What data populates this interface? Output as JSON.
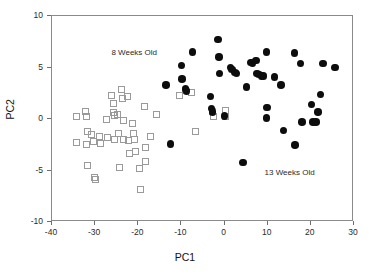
{
  "chart_data": {
    "type": "scatter",
    "title": "",
    "xlabel": "PC1",
    "ylabel": "PC2",
    "xlim": [
      -40,
      30
    ],
    "ylim": [
      -10,
      10
    ],
    "xticks": [
      -40,
      -30,
      -20,
      -10,
      0,
      10,
      20,
      30
    ],
    "yticks": [
      -10,
      -5,
      0,
      5,
      10
    ],
    "xticklabels": [
      "-40",
      "-30",
      "-20",
      "-10",
      "0",
      "10",
      "20",
      "30"
    ],
    "yticklabels": [
      "-10",
      "-5",
      "0",
      "5",
      "10"
    ],
    "grid": false,
    "legend_position": "in-plot-annotations",
    "annotations": [
      {
        "text": "8 Weeks Old",
        "x": -26.0,
        "y": 6.2
      },
      {
        "text": "13 Weeks Old",
        "x": 9.5,
        "y": -5.4
      }
    ],
    "series": [
      {
        "name": "8 Weeks Old",
        "marker": "open-square",
        "color": "#9a9a9a",
        "fill": "none",
        "points": [
          [
            -34.2,
            0.1
          ],
          [
            -34.0,
            -2.4
          ],
          [
            -31.9,
            0.6
          ],
          [
            -31.8,
            0.1
          ],
          [
            -31.6,
            -1.3
          ],
          [
            -31.7,
            -2.6
          ],
          [
            -31.5,
            -4.6
          ],
          [
            -30.5,
            -1.6
          ],
          [
            -30.2,
            -2.3
          ],
          [
            -30.0,
            -5.8
          ],
          [
            -29.6,
            -6.0
          ],
          [
            -28.8,
            -1.8
          ],
          [
            -28.6,
            -2.5
          ],
          [
            -27.2,
            -0.1
          ],
          [
            -27.0,
            -1.9
          ],
          [
            -25.9,
            2.2
          ],
          [
            -25.6,
            1.4
          ],
          [
            -25.4,
            0.5
          ],
          [
            -25.2,
            0.2
          ],
          [
            -25.3,
            -2.1
          ],
          [
            -24.6,
            0.3
          ],
          [
            -24.4,
            -1.5
          ],
          [
            -24.2,
            -4.8
          ],
          [
            -23.6,
            2.8
          ],
          [
            -23.5,
            1.9
          ],
          [
            -23.3,
            -0.2
          ],
          [
            -23.2,
            -2.1
          ],
          [
            -22.2,
            2.1
          ],
          [
            -22.0,
            -2.2
          ],
          [
            -21.9,
            -3.4
          ],
          [
            -21.0,
            -0.5
          ],
          [
            -20.8,
            -1.5
          ],
          [
            -20.6,
            -2.1
          ],
          [
            -20.4,
            -3.3
          ],
          [
            -19.4,
            -4.9
          ],
          [
            -19.2,
            -6.9
          ],
          [
            -18.4,
            1.1
          ],
          [
            -18.2,
            -2.9
          ],
          [
            -18.0,
            -4.2
          ],
          [
            -17.0,
            -1.8
          ],
          [
            -15.6,
            0.3
          ],
          [
            -10.2,
            2.2
          ],
          [
            -8.8,
            2.7
          ],
          [
            -7.4,
            2.5
          ],
          [
            -6.6,
            -1.3
          ],
          [
            -2.6,
            0.6
          ],
          [
            -2.4,
            0.1
          ],
          [
            0.4,
            0.7
          ],
          [
            0.5,
            0.1
          ]
        ]
      },
      {
        "name": "13 Weeks Old",
        "marker": "filled-circle",
        "color": "#0d0d0d",
        "fill": "#0d0d0d",
        "points": [
          [
            -13.3,
            3.2
          ],
          [
            -12.3,
            -2.5
          ],
          [
            -9.8,
            5.1
          ],
          [
            -9.6,
            3.8
          ],
          [
            -8.8,
            2.8
          ],
          [
            -8.6,
            2.6
          ],
          [
            -7.2,
            6.4
          ],
          [
            -3.0,
            2.1
          ],
          [
            -2.8,
            0.9
          ],
          [
            -2.6,
            0.6
          ],
          [
            -1.3,
            7.6
          ],
          [
            -1.1,
            5.9
          ],
          [
            -1.0,
            4.3
          ],
          [
            0.2,
            0.2
          ],
          [
            1.6,
            4.9
          ],
          [
            2.0,
            4.7
          ],
          [
            2.6,
            4.4
          ],
          [
            3.0,
            4.3
          ],
          [
            4.5,
            -4.3
          ],
          [
            5.3,
            3.0
          ],
          [
            6.3,
            5.4
          ],
          [
            6.7,
            5.3
          ],
          [
            7.5,
            5.6
          ],
          [
            7.7,
            4.3
          ],
          [
            8.2,
            4.2
          ],
          [
            8.8,
            4.1
          ],
          [
            9.2,
            4.1
          ],
          [
            9.9,
            6.4
          ],
          [
            10.1,
            1.0
          ],
          [
            10.0,
            0.0
          ],
          [
            11.8,
            4.0
          ],
          [
            13.3,
            3.2
          ],
          [
            13.9,
            -1.2
          ],
          [
            16.4,
            6.3
          ],
          [
            16.6,
            -2.6
          ],
          [
            17.8,
            5.3
          ],
          [
            18.2,
            -0.4
          ],
          [
            20.4,
            1.3
          ],
          [
            20.7,
            -0.4
          ],
          [
            21.4,
            -0.4
          ],
          [
            21.9,
            0.6
          ],
          [
            22.5,
            2.3
          ],
          [
            23.0,
            5.3
          ],
          [
            25.8,
            4.9
          ]
        ]
      }
    ]
  }
}
